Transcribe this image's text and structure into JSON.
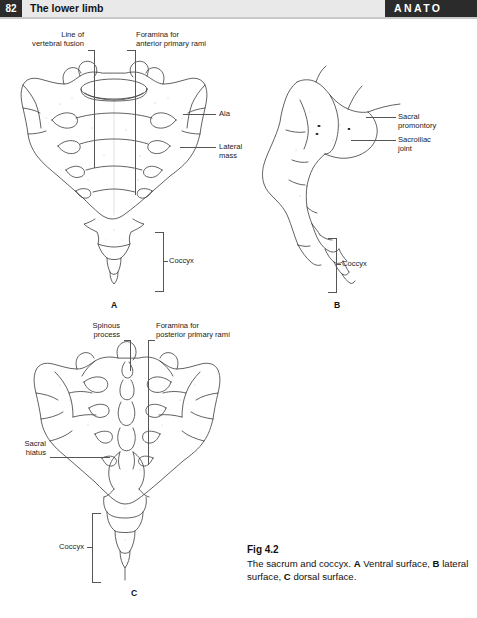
{
  "header": {
    "page_number": "82",
    "title": "The lower limb",
    "section": "ANATO"
  },
  "figure": {
    "caption_title": "Fig 4.2",
    "caption_text_1": "The sacrum and coccyx. ",
    "caption_bold_a": "A",
    "caption_text_2": " Ventral surface, ",
    "caption_bold_b": "B",
    "caption_text_3": " lateral surface, ",
    "caption_bold_c": "C",
    "caption_text_4": " dorsal surface."
  },
  "panels": {
    "a": {
      "letter": "A",
      "labels": {
        "line_of_vertebral_fusion": "Line of\nvertebral fusion",
        "foramina_anterior_primary_rami": "Foramina for\nanterior primary rami",
        "ala": "Ala",
        "lateral_mass": "Lateral\nmass",
        "coccyx": "Coccyx"
      }
    },
    "b": {
      "letter": "B",
      "labels": {
        "sacral_promontory": "Sacral\npromontory",
        "sacroiliac_joint": "Sacroiliac\njoint",
        "coccyx": "Coccyx"
      }
    },
    "c": {
      "letter": "C",
      "labels": {
        "spinous_process": "Spinous\nprocess",
        "foramina_posterior_primary_rami": "Foramina for\nposterior primary rami",
        "sacral_hiatus": "Sacral\nhiatus",
        "coccyx": "Coccyx"
      }
    }
  },
  "colors": {
    "header_dark": "#2b2b2b",
    "header_band": "#e9e9e9",
    "ink": "#3a3a3a",
    "leader": "#555555"
  }
}
